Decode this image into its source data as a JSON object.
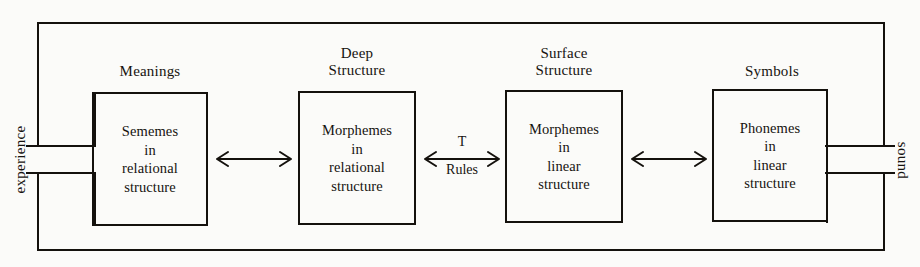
{
  "diagram": {
    "line_color": "#14110d",
    "background_color": "#fbfbf9",
    "end_labels": {
      "input": "experience",
      "output": "sound"
    },
    "stages": [
      {
        "caption": "Meanings",
        "body": "Sememes\nin\nrelational\nstructure"
      },
      {
        "caption": "Deep\nStructure",
        "body": "Morphemes\nin\nrelational\nstructure"
      },
      {
        "caption": "Surface\nStructure",
        "body": "Morphemes\nin\nlinear\nstructure"
      },
      {
        "caption": "Symbols",
        "body": "Phonemes\nin\nlinear\nstructure"
      }
    ],
    "connectors": [
      {
        "label_top": "",
        "label_bottom": ""
      },
      {
        "label_top": "T",
        "label_bottom": "Rules"
      },
      {
        "label_top": "",
        "label_bottom": ""
      }
    ]
  }
}
